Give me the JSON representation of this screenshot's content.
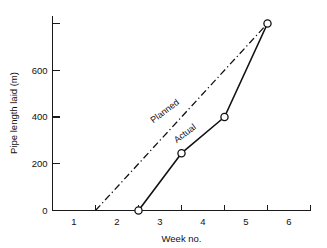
{
  "chart_data": {
    "type": "line",
    "title": "",
    "xlabel": "Week no.",
    "ylabel": "Pipe length laid (m)",
    "xlim": [
      0.5,
      6.5
    ],
    "ylim": [
      0,
      830
    ],
    "grid": false,
    "legend": "inline-annotations",
    "x_tick_labels": [
      "1",
      "2",
      "3",
      "4",
      "5",
      "6"
    ],
    "x_tick_values": [
      1,
      2,
      3,
      4,
      5,
      6
    ],
    "x_tick_mark_values": [
      0.5,
      1.5,
      2.5,
      3.5,
      4.5,
      5.5,
      6.5
    ],
    "y_tick_labels": [
      "0",
      "200",
      "400",
      "600"
    ],
    "y_tick_values": [
      0,
      200,
      400,
      600
    ],
    "y_tick_mark_values": [
      0,
      200,
      400,
      600,
      800
    ],
    "series": [
      {
        "name": "Planned",
        "style": "dash-dot",
        "markers": false,
        "x": [
          1.5,
          5.5
        ],
        "values": [
          0,
          800
        ]
      },
      {
        "name": "Actual",
        "style": "solid",
        "markers": true,
        "x": [
          2.5,
          3.5,
          4.5,
          5.5
        ],
        "values": [
          0,
          245,
          400,
          800
        ]
      }
    ],
    "annotations": [
      {
        "text": "Planned",
        "x": 3.15,
        "y": 415,
        "rotation": -37
      },
      {
        "text": "Actual",
        "x": 3.62,
        "y": 320,
        "rotation": -37
      }
    ],
    "colors": {
      "axis": "#1a1a1a",
      "planned": "#111111",
      "actual": "#111111",
      "marker_fill": "#ffffff",
      "background": "#ffffff"
    }
  }
}
